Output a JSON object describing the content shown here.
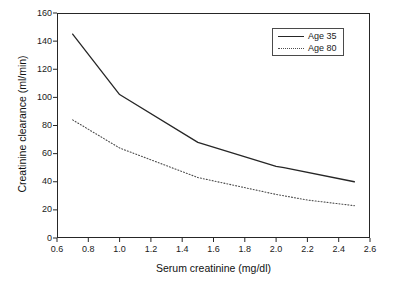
{
  "chart_data": {
    "type": "line",
    "title": "",
    "xlabel": "Serum creatinine (mg/dl)",
    "ylabel": "Creatinine clearance (ml/min)",
    "xlim": [
      0.6,
      2.6
    ],
    "ylim": [
      0,
      160
    ],
    "xticks": [
      "0.6",
      "0.8",
      "1.0",
      "1.2",
      "1.4",
      "1.6",
      "1.8",
      "2.0",
      "2.2",
      "2.4",
      "2.6"
    ],
    "xtick_values": [
      0.6,
      0.8,
      1.0,
      1.2,
      1.4,
      1.6,
      1.8,
      2.0,
      2.2,
      2.4,
      2.6
    ],
    "yticks": [
      "0",
      "20",
      "40",
      "60",
      "80",
      "100",
      "120",
      "140",
      "160"
    ],
    "ytick_values": [
      0,
      20,
      40,
      60,
      80,
      100,
      120,
      140,
      160
    ],
    "grid": false,
    "legend_position": "top-right",
    "series": [
      {
        "name": "Age 35",
        "style": "solid",
        "color": "#262626",
        "x": [
          0.7,
          1.0,
          1.5,
          2.0,
          2.05,
          2.5
        ],
        "values": [
          145,
          102,
          68,
          51,
          50,
          40
        ]
      },
      {
        "name": "Age 80",
        "style": "dotted",
        "color": "#4d4d4d",
        "x": [
          0.7,
          1.0,
          1.5,
          2.0,
          2.2,
          2.5
        ],
        "values": [
          84,
          64,
          43,
          31,
          27,
          23
        ]
      }
    ]
  },
  "legend": {
    "entries": [
      {
        "label": "Age 35"
      },
      {
        "label": "Age 80"
      }
    ]
  },
  "colors": {
    "axis": "#262626",
    "series_solid": "#262626",
    "series_dotted": "#4d4d4d",
    "background": "#ffffff"
  }
}
